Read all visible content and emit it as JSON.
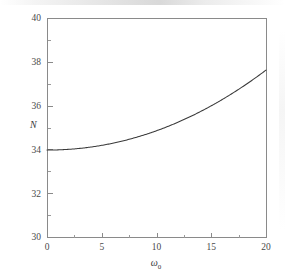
{
  "chart_data": {
    "type": "line",
    "title": "",
    "subtitle": "",
    "xlabel": "ω₀",
    "xlabel_base": "ω",
    "xlabel_subscript": "0",
    "ylabel": "N",
    "xlim": [
      0,
      20
    ],
    "ylim": [
      30,
      40
    ],
    "x_major_ticks": [
      0,
      5,
      10,
      15,
      20
    ],
    "x_major_tick_labels": [
      "0",
      "5",
      "10",
      "15",
      "20"
    ],
    "x_minor_ticks": [
      2.5,
      7.5,
      12.5,
      17.5
    ],
    "y_major_ticks": [
      30,
      32,
      34,
      36,
      38,
      40
    ],
    "y_major_tick_labels": [
      "30",
      "32",
      "34",
      "36",
      "38",
      "40"
    ],
    "y_minor_ticks": [
      31,
      33,
      35,
      37,
      39
    ],
    "grid": false,
    "legend": null,
    "legend_position": "none",
    "series": [
      {
        "name": "N(ω₀)",
        "color": "#3a3a3a",
        "x": [
          0,
          1,
          2,
          3,
          4,
          5,
          6,
          7,
          8,
          9,
          10,
          11,
          12,
          13,
          14,
          15,
          16,
          17,
          18,
          19,
          20
        ],
        "y": [
          33.97,
          33.98,
          34.01,
          34.06,
          34.14,
          34.24,
          34.36,
          34.51,
          34.68,
          34.88,
          35.1,
          35.35,
          35.62,
          35.92,
          36.24,
          36.0,
          36.4,
          36.8,
          37.0,
          37.3,
          37.62
        ]
      }
    ],
    "annotations": []
  },
  "colors": {
    "background": "#ffffff",
    "axis": "#8a8a8a",
    "curve": "#3a3a3a",
    "text": "#4a4a4a"
  },
  "figure": {
    "width": 285,
    "height": 277,
    "plot_left": 47,
    "plot_right": 266,
    "plot_top": 18,
    "plot_bottom": 237
  }
}
